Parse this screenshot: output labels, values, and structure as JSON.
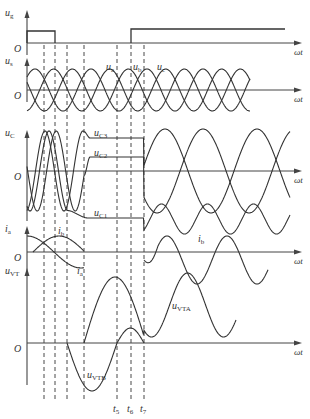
{
  "colors": {
    "curve": "#333333",
    "axis": "#444444",
    "dash": "#333333"
  },
  "figure": {
    "width": 310,
    "height": 419,
    "y_axis_x": 27,
    "x_axis_end": 302,
    "x_label": "ωt",
    "origin_label": "O",
    "dashed_lines_x": [
      44,
      55,
      67,
      84,
      117,
      131,
      144
    ],
    "dashed_span": {
      "top": 45,
      "bottom": 400
    },
    "time_labels": [
      {
        "text": "t",
        "sub": "5",
        "x": 117
      },
      {
        "text": "t",
        "sub": "6",
        "x": 131
      },
      {
        "text": "t",
        "sub": "7",
        "x": 144
      }
    ]
  },
  "panels": [
    {
      "id": "ug",
      "y_label": "u",
      "y_sub": "g",
      "axis_y": 43,
      "axis_top": 10,
      "curves": [
        {
          "name": "gate-pulse",
          "label": "",
          "points": [
            [
              27,
              43
            ],
            [
              27,
              31
            ],
            [
              55,
              31
            ],
            [
              55,
              43
            ]
          ]
        },
        {
          "name": "gate-pulse-2",
          "label": "",
          "points": [
            [
              131,
              43
            ],
            [
              131,
              29
            ],
            [
              285,
              29
            ]
          ]
        }
      ]
    },
    {
      "id": "us",
      "y_label": "u",
      "y_sub": "s",
      "axis_y": 90,
      "axis_top": 58,
      "phase_labels": [
        {
          "text": "u",
          "sub": "a",
          "x": 106,
          "y": 62
        },
        {
          "text": "u",
          "sub": "b",
          "x": 133,
          "y": 62
        },
        {
          "text": "u",
          "sub": "c",
          "x": 157,
          "y": 62
        }
      ]
    },
    {
      "id": "uC",
      "y_label": "u",
      "y_sub": "C",
      "axis_y": 171,
      "axis_top": 130,
      "curve_labels": [
        {
          "text": "u",
          "sub": "C3",
          "x": 94,
          "y": 128
        },
        {
          "text": "u",
          "sub": "C2",
          "x": 94,
          "y": 148
        },
        {
          "text": "u",
          "sub": "C1",
          "x": 94,
          "y": 208
        }
      ]
    },
    {
      "id": "i",
      "y_label": "i",
      "y_sub": "a",
      "axis_y": 252,
      "axis_top": 226,
      "curve_labels": [
        {
          "text": "i",
          "sub": "b",
          "x": 58,
          "y": 226
        },
        {
          "text": "i",
          "sub": "a",
          "x": 77,
          "y": 266
        },
        {
          "text": "i",
          "sub": "b",
          "x": 198,
          "y": 234
        }
      ]
    },
    {
      "id": "uVT",
      "y_label": "u",
      "y_sub": "VT",
      "axis_y": 343,
      "axis_top": 268,
      "curve_labels": [
        {
          "text": "u",
          "sub": "VTA",
          "x": 172,
          "y": 301
        },
        {
          "text": "u",
          "sub": "VTB",
          "x": 87,
          "y": 370
        }
      ]
    }
  ]
}
